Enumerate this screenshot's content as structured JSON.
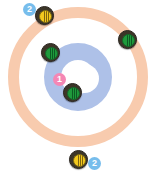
{
  "diagram": {
    "colors": {
      "background": "#ffffff",
      "outer_ring": "#f8cbae",
      "inner_ring": "#aec1e8",
      "button": "#ffffff",
      "stone_body": "#3c3528",
      "stone_yellow": "#f2c81e",
      "stone_green": "#1f9a3c",
      "badge_blue": "#77bdec",
      "badge_pink": "#f587b4"
    },
    "rings": [
      {
        "name": "outer-ring",
        "label": "12-foot",
        "color": "#f8cbae"
      },
      {
        "name": "inner-ring",
        "label": "4-foot",
        "color": "#aec1e8"
      },
      {
        "name": "button",
        "label": "button",
        "color": "#ffffff"
      }
    ],
    "stones": [
      {
        "id": "stone-top-left",
        "team": "yellow",
        "x": 35,
        "y": 6,
        "handle_lines": 3
      },
      {
        "id": "stone-upper-left",
        "team": "green",
        "x": 41,
        "y": 43,
        "handle_lines": 3
      },
      {
        "id": "stone-upper-right",
        "team": "green",
        "x": 118,
        "y": 30,
        "handle_lines": 3
      },
      {
        "id": "stone-center",
        "team": "green",
        "x": 63,
        "y": 83,
        "handle_lines": 3
      },
      {
        "id": "stone-bottom",
        "team": "yellow",
        "x": 69,
        "y": 150,
        "handle_lines": 3
      }
    ],
    "badges": [
      {
        "id": "badge-top-left",
        "text": "2",
        "color": "blue",
        "x": 23,
        "y": 3
      },
      {
        "id": "badge-center",
        "text": "1",
        "color": "pink",
        "x": 53,
        "y": 73
      },
      {
        "id": "badge-bottom",
        "text": "2",
        "color": "blue",
        "x": 88,
        "y": 157
      }
    ]
  }
}
